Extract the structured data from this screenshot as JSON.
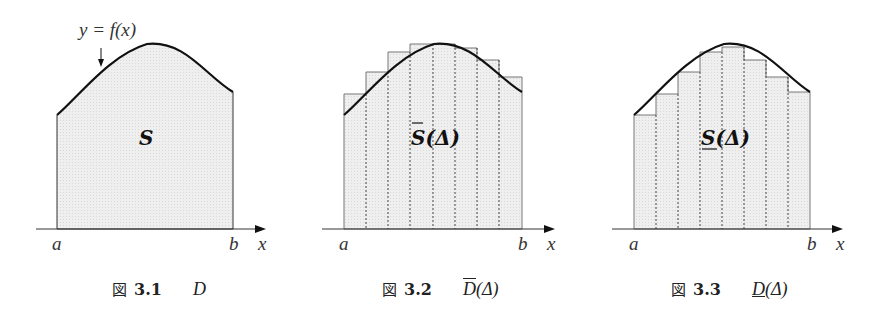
{
  "figures": [
    {
      "id": "fig-3-1",
      "curve_label": "y = f(x)",
      "region_label": "S",
      "axis": {
        "left": "a",
        "right": "b",
        "var": "x"
      },
      "caption": {
        "prefix": "図",
        "number": "3.1",
        "symbol": "D",
        "decoration": "none"
      }
    },
    {
      "id": "fig-3-2",
      "region_label": "S(Δ)",
      "region_decoration": "overline",
      "strips": 8,
      "axis": {
        "left": "a",
        "right": "b",
        "var": "x"
      },
      "caption": {
        "prefix": "図",
        "number": "3.2",
        "symbol": "D",
        "symbol_suffix": "(Δ)",
        "decoration": "overline"
      }
    },
    {
      "id": "fig-3-3",
      "region_label": "S(Δ)",
      "region_decoration": "underline",
      "strips": 8,
      "axis": {
        "left": "a",
        "right": "b",
        "var": "x"
      },
      "caption": {
        "prefix": "図",
        "number": "3.3",
        "symbol": "D",
        "symbol_suffix": "(Δ)",
        "decoration": "underline"
      }
    }
  ],
  "colors": {
    "fill": "#ececec",
    "line": "#111111",
    "rect": "#777777",
    "dotted": "#444444"
  }
}
